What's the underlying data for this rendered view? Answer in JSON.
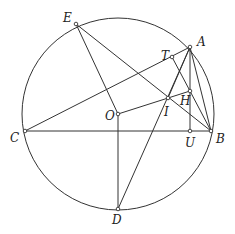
{
  "diagram": {
    "type": "geometry",
    "circle": {
      "center": "O",
      "cx": 118,
      "cy": 114,
      "r": 96
    },
    "points": [
      {
        "id": "A",
        "label": "A",
        "x": 190,
        "y": 47,
        "lx": 197,
        "ly": 46
      },
      {
        "id": "B",
        "label": "B",
        "x": 211,
        "y": 131,
        "lx": 216,
        "ly": 143
      },
      {
        "id": "C",
        "label": "C",
        "x": 25,
        "y": 131,
        "lx": 10,
        "ly": 142
      },
      {
        "id": "D",
        "label": "D",
        "x": 118,
        "y": 209,
        "lx": 112,
        "ly": 224
      },
      {
        "id": "E",
        "label": "E",
        "x": 76,
        "y": 24,
        "lx": 63,
        "ly": 22
      },
      {
        "id": "O",
        "label": "O",
        "x": 118,
        "y": 114,
        "lx": 105,
        "ly": 120
      },
      {
        "id": "T",
        "label": "T",
        "x": 172,
        "y": 57,
        "lx": 161,
        "ly": 60
      },
      {
        "id": "H",
        "label": "H",
        "x": 190,
        "y": 91,
        "lx": 180,
        "ly": 105
      },
      {
        "id": "I",
        "label": "I",
        "x": 168,
        "y": 98,
        "lx": 164,
        "ly": 116
      },
      {
        "id": "U",
        "label": "U",
        "x": 190,
        "y": 131,
        "lx": 185,
        "ly": 147
      }
    ],
    "segments": [
      [
        "E",
        "O"
      ],
      [
        "E",
        "B"
      ],
      [
        "C",
        "A"
      ],
      [
        "C",
        "B"
      ],
      [
        "O",
        "H"
      ],
      [
        "O",
        "D"
      ],
      [
        "D",
        "A"
      ],
      [
        "A",
        "U"
      ],
      [
        "A",
        "B"
      ],
      [
        "H",
        "B"
      ],
      [
        "T",
        "H"
      ],
      [
        "A",
        "I"
      ]
    ]
  }
}
